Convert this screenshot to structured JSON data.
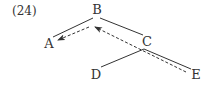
{
  "example_number": "(24)",
  "tree": {
    "nodes": [
      {
        "id": "B",
        "label": "B",
        "x": 97,
        "y": 9
      },
      {
        "id": "A",
        "label": "A",
        "x": 49,
        "y": 43
      },
      {
        "id": "C",
        "label": "C",
        "x": 147,
        "y": 41
      },
      {
        "id": "D",
        "label": "D",
        "x": 96,
        "y": 74
      },
      {
        "id": "E",
        "label": "E",
        "x": 196,
        "y": 74
      }
    ],
    "edges": [
      {
        "from": "B",
        "to": "A",
        "style": "solid"
      },
      {
        "from": "B",
        "to": "C",
        "style": "solid"
      },
      {
        "from": "C",
        "to": "D",
        "style": "solid"
      },
      {
        "from": "C",
        "to": "E",
        "style": "solid"
      }
    ],
    "movement_arrows": [
      {
        "from": "E",
        "to": "B",
        "style": "dashed"
      },
      {
        "from": "B",
        "to": "A",
        "style": "dashed"
      }
    ]
  },
  "colors": {
    "line": "#333333",
    "text": "#333333",
    "background": "#ffffff"
  }
}
